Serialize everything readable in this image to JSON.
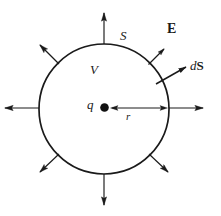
{
  "figure": {
    "background_color": "#ffffff",
    "stroke_color": "#1a1a1a",
    "width": 221,
    "height": 216
  },
  "surface": {
    "name": "gaussian-sphere",
    "center_x": 104,
    "center_y": 109,
    "radius": 65,
    "stroke_width": 1.6
  },
  "charge": {
    "label": "q",
    "marker": "filled-dot",
    "x": 104,
    "y": 107,
    "dot_radius": 4.2,
    "color": "#111111"
  },
  "labels": {
    "surface_label": "S",
    "volume_label": "V",
    "charge_label": "q",
    "radius_label": "r",
    "field_label": "E",
    "area_element_label_d": "d",
    "area_element_label_S": "S",
    "area_element_label": "dS"
  },
  "label_positions": {
    "surface_label": {
      "x": 120,
      "y": 30
    },
    "volume_label": {
      "x": 91,
      "y": 64
    },
    "charge_label": {
      "x": 88,
      "y": 99
    },
    "radius_label": {
      "x": 126,
      "y": 112
    },
    "field_label": {
      "x": 168,
      "y": 23
    },
    "area_element_label": {
      "x": 191,
      "y": 60
    }
  },
  "radius_vector": {
    "name": "radius-arrow",
    "from_x": 110,
    "from_y": 108,
    "to_x": 168,
    "to_y": 108,
    "double_headed": true,
    "label": "r"
  },
  "area_element_vector": {
    "name": "dS-normal-arrow",
    "from_x": 157,
    "from_y": 83,
    "to_x": 188,
    "to_y": 66,
    "label": "dS"
  },
  "field_arrows": [
    {
      "name": "field-arrow-up",
      "angle_deg": 90,
      "length": 30,
      "labeled": false
    },
    {
      "name": "field-arrow-upper-right",
      "angle_deg": 48,
      "length": 22,
      "labeled": true,
      "label": "E"
    },
    {
      "name": "field-arrow-right",
      "angle_deg": 0,
      "length": 32,
      "labeled": false
    },
    {
      "name": "field-arrow-lower-right",
      "angle_deg": -45,
      "length": 26,
      "labeled": false
    },
    {
      "name": "field-arrow-down",
      "angle_deg": -90,
      "length": 30,
      "labeled": false
    },
    {
      "name": "field-arrow-lower-left",
      "angle_deg": -135,
      "length": 26,
      "labeled": false
    },
    {
      "name": "field-arrow-left",
      "angle_deg": 180,
      "length": 32,
      "labeled": false
    },
    {
      "name": "field-arrow-upper-left",
      "angle_deg": 135,
      "length": 26,
      "labeled": false
    }
  ],
  "font_sizes": {
    "surface_label": 13,
    "volume_label": 13,
    "charge_label": 13,
    "radius_label": 11,
    "field_label": 14,
    "area_element_label": 13
  }
}
